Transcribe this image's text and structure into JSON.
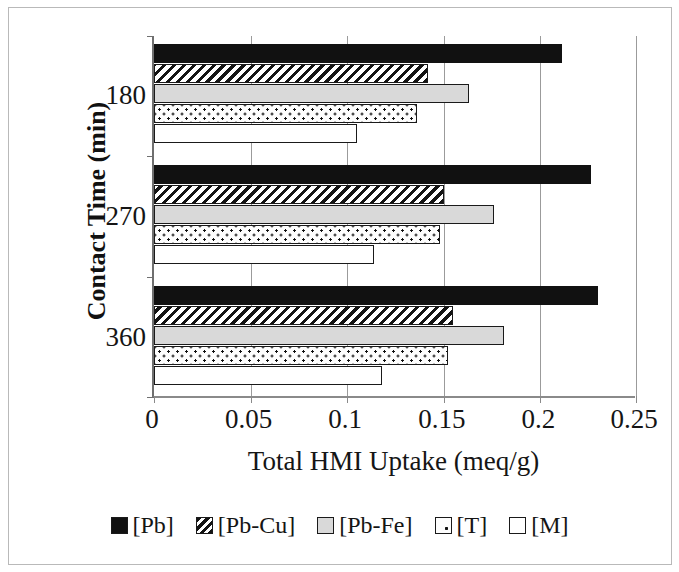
{
  "chart_data": {
    "type": "bar",
    "orientation": "horizontal",
    "title": "",
    "xlabel": "Total HMI Uptake (meq/g)",
    "ylabel": "Contact Time (min)",
    "categories": [
      "180",
      "270",
      "360"
    ],
    "xlim": [
      0,
      0.25
    ],
    "xticks": [
      "0",
      "0.05",
      "0.1",
      "0.15",
      "0.2",
      "0.25"
    ],
    "xtick_values": [
      0,
      0.05,
      0.1,
      0.15,
      0.2,
      0.25
    ],
    "grid": true,
    "legend_position": "bottom",
    "series": [
      {
        "name": "[Pb]",
        "pattern": "solid-black",
        "values": [
          0.211,
          0.226,
          0.23
        ]
      },
      {
        "name": "[Pb-Cu]",
        "pattern": "diagonal-hatch",
        "values": [
          0.142,
          0.15,
          0.155
        ]
      },
      {
        "name": "[Pb-Fe]",
        "pattern": "light-gray",
        "values": [
          0.163,
          0.176,
          0.181
        ]
      },
      {
        "name": "[T]",
        "pattern": "dotted",
        "values": [
          0.136,
          0.148,
          0.152
        ]
      },
      {
        "name": "[M]",
        "pattern": "white-empty",
        "values": [
          0.105,
          0.114,
          0.118
        ]
      }
    ]
  },
  "axes": {
    "x_title": "Total HMI Uptake (meq/g)",
    "y_title": "Contact Time (min)",
    "x_ticks": [
      "0",
      "0.05",
      "0.1",
      "0.15",
      "0.2",
      "0.25"
    ],
    "y_ticks": [
      "180",
      "270",
      "360"
    ]
  },
  "legend": {
    "items": [
      {
        "label": "[Pb]",
        "swatch": "solid-black-swatch"
      },
      {
        "label": "[Pb-Cu]",
        "swatch": "hatched-swatch"
      },
      {
        "label": "[Pb-Fe]",
        "swatch": "gray-swatch"
      },
      {
        "label": "[T]",
        "swatch": "dotted-swatch"
      },
      {
        "label": "[M]",
        "swatch": "white-swatch"
      }
    ]
  },
  "colors": {
    "pb": "#111111",
    "pb_fe": "#d9d9d9",
    "outline": "#1a1a1a",
    "gridline": "#9b9b9b",
    "axis": "#6f6f6f",
    "text": "#151515",
    "background": "#ffffff"
  }
}
